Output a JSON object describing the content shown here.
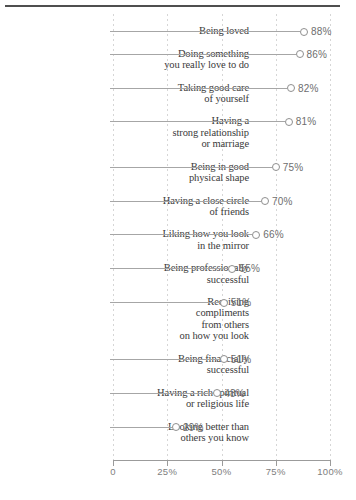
{
  "chart_data": {
    "type": "scatter",
    "variant": "dot-plot-lollipop",
    "title": "",
    "xlabel": "",
    "ylabel": "",
    "xlim": [
      0,
      100
    ],
    "grid": "vertical-dashed",
    "legend": "none",
    "x_ticks": [
      {
        "value": 0,
        "label": "0"
      },
      {
        "value": 25,
        "label": "25%"
      },
      {
        "value": 50,
        "label": "50%"
      },
      {
        "value": 75,
        "label": "75%"
      },
      {
        "value": 100,
        "label": "100%"
      }
    ],
    "points": [
      {
        "label_lines": [
          "Being loved"
        ],
        "value": 88,
        "value_label": "88%"
      },
      {
        "label_lines": [
          "Doing something",
          "you really love to do"
        ],
        "value": 86,
        "value_label": "86%"
      },
      {
        "label_lines": [
          "Taking good care",
          "of yourself"
        ],
        "value": 82,
        "value_label": "82%"
      },
      {
        "label_lines": [
          "Having a",
          "strong relationship",
          "or marriage"
        ],
        "value": 81,
        "value_label": "81%"
      },
      {
        "label_lines": [
          "Being in good",
          "physical shape"
        ],
        "value": 75,
        "value_label": "75%"
      },
      {
        "label_lines": [
          "Having a close circle",
          "of friends"
        ],
        "value": 70,
        "value_label": "70%"
      },
      {
        "label_lines": [
          "Liking how you look",
          "in the mirror"
        ],
        "value": 66,
        "value_label": "66%"
      },
      {
        "label_lines": [
          "Being professionally",
          "successful"
        ],
        "value": 55,
        "value_label": "55%"
      },
      {
        "label_lines": [
          "Receiving",
          "compliments",
          "from others",
          "on how you look"
        ],
        "value": 51,
        "value_label": "51%"
      },
      {
        "label_lines": [
          "Being financially",
          "successful"
        ],
        "value": 51,
        "value_label": "51%"
      },
      {
        "label_lines": [
          "Having a rich spiritual",
          "or religious life"
        ],
        "value": 48,
        "value_label": "48%"
      },
      {
        "label_lines": [
          "Looking better than",
          "others you know"
        ],
        "value": 29,
        "value_label": "29%"
      }
    ]
  },
  "colors": {
    "background": "#ffffff",
    "top_rule": "#4f4f4f",
    "category_text": "#3a3a3a",
    "connector": "#a6a6a6",
    "marker_stroke": "#8f8f8f",
    "marker_fill": "#ffffff",
    "value_text": "#6e6e6e",
    "gridline": "#d6d6d6",
    "axis": "#9b9b9b",
    "tick_label_text": "#7e7e7e"
  }
}
